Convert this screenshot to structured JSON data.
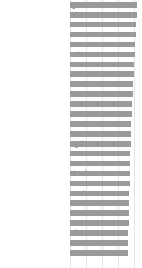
{
  "chart": {
    "background_color": "#ffffff",
    "bar_color": "#9a9a9a",
    "gridline_color": "#e2e2e6",
    "label_color": "#2a2a2a"
  },
  "chart_data": {
    "type": "bar",
    "orientation": "horizontal",
    "title": "",
    "subtitle": "",
    "xlabel": "",
    "ylabel": "",
    "grid": true,
    "grid_axis": "x",
    "legend": false,
    "legend_position": "none",
    "xlim": [
      0,
      100
    ],
    "tick_labels": [],
    "axis_visible": false,
    "categories": [
      "Hong Kong",
      "Singapore",
      "France",
      "Israel",
      "Japan",
      "Switzerland",
      "Denmark",
      "Norway",
      "South Korea",
      "Austria",
      "Australia",
      "Finland",
      "Jordan",
      "Ireland",
      "United Kingdom",
      "Thailand",
      "Iceland",
      "New Caledonia",
      "Canada",
      "New Zealand",
      "Spain",
      "Belgium",
      "Italy",
      "Netherlands",
      "UAE",
      "China"
    ],
    "values": [
      94,
      93,
      92,
      91,
      90,
      89,
      88,
      87,
      86,
      85,
      84,
      83,
      82,
      81,
      81,
      80,
      80,
      79,
      79,
      78,
      78,
      77,
      77,
      76,
      76,
      75
    ]
  }
}
